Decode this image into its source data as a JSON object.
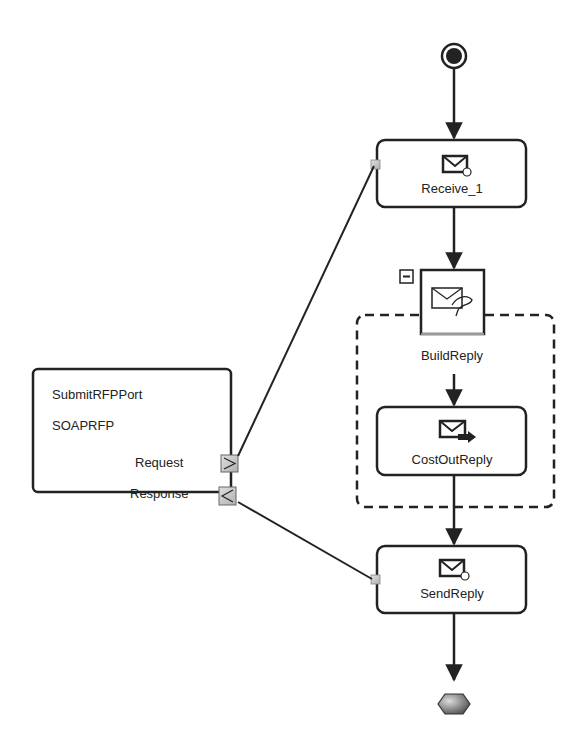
{
  "diagram": {
    "type": "BPEL process flow",
    "start": {
      "label": "start-event"
    },
    "end": {
      "label": "end-event"
    },
    "nodes": [
      {
        "id": "receive",
        "label": "Receive_1",
        "icon": "receive-envelope-icon"
      },
      {
        "id": "buildreply",
        "label": "BuildReply",
        "icon": "construct-message-icon",
        "collapse_glyph": "−"
      },
      {
        "id": "costout",
        "label": "CostOutReply",
        "icon": "send-envelope-icon"
      },
      {
        "id": "sendreply",
        "label": "SendReply",
        "icon": "send-envelope-icon"
      }
    ],
    "port": {
      "name": "SubmitRFPPort",
      "type": "SOAPRFP",
      "operations": [
        {
          "label": "Request",
          "glyph": ">"
        },
        {
          "label": "Response",
          "glyph": "<"
        }
      ]
    },
    "edges": [
      {
        "from": "start",
        "to": "receive"
      },
      {
        "from": "receive",
        "to": "buildreply"
      },
      {
        "from": "buildreply",
        "to": "costout"
      },
      {
        "from": "costout",
        "to": "sendreply"
      },
      {
        "from": "sendreply",
        "to": "end"
      },
      {
        "from": "port.Request",
        "to": "receive"
      },
      {
        "from": "sendreply",
        "to": "port.Response"
      }
    ],
    "colors": {
      "stroke": "#222222",
      "port_fill": "#c8c8c8",
      "end_fill": "#888888"
    }
  }
}
